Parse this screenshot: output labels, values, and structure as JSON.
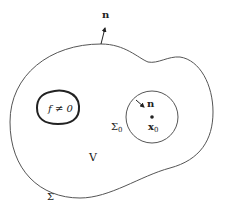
{
  "diagram": {
    "type": "region-schematic",
    "colors": {
      "line": "#555555",
      "thick_line": "#222222",
      "text": "#222222",
      "background": "#ffffff"
    },
    "labels": {
      "outer_normal": "n",
      "source_region": "f ≠ 0",
      "inner_normal": "n",
      "point": "x",
      "point_subscript": "0",
      "inner_surface": "Σ",
      "inner_surface_subscript": "0",
      "volume": "V",
      "outer_surface": "Σ"
    }
  }
}
